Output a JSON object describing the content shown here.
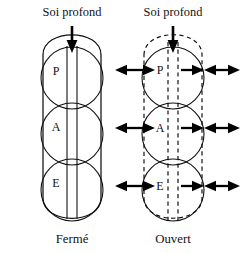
{
  "figure": {
    "background_color": "#ffffff",
    "ink_color": "#111111",
    "width": 245,
    "height": 253
  },
  "panels": [
    {
      "id": "closed",
      "top_label": "Soi profond",
      "caption": "Fermé",
      "boundary_style": "solid",
      "channel_style": "solid",
      "nodes": [
        {
          "key": "P",
          "label": "P"
        },
        {
          "key": "A",
          "label": "A"
        },
        {
          "key": "E",
          "label": "E"
        }
      ],
      "inflow_arrow": {
        "name": "down-arrow",
        "direction": "down",
        "style": "solid"
      },
      "outflow_arrows": []
    },
    {
      "id": "open",
      "top_label": "Soi profond",
      "caption": "Ouvert",
      "boundary_style": "dashed",
      "channel_style": "dashed",
      "nodes": [
        {
          "key": "P",
          "label": "P"
        },
        {
          "key": "A",
          "label": "A"
        },
        {
          "key": "E",
          "label": "E"
        }
      ],
      "inflow_arrow": {
        "name": "down-arrow",
        "direction": "down",
        "style": "solid"
      },
      "outflow_arrows": [
        {
          "row": "P",
          "side": "left",
          "direction": "bidirectional"
        },
        {
          "row": "P",
          "side": "right-inner",
          "direction": "right"
        },
        {
          "row": "P",
          "side": "right-outer",
          "direction": "bidirectional"
        },
        {
          "row": "A",
          "side": "left",
          "direction": "bidirectional"
        },
        {
          "row": "A",
          "side": "right-inner",
          "direction": "right"
        },
        {
          "row": "A",
          "side": "right-outer",
          "direction": "bidirectional"
        },
        {
          "row": "E",
          "side": "left",
          "direction": "bidirectional"
        },
        {
          "row": "E",
          "side": "right-inner",
          "direction": "right"
        },
        {
          "row": "E",
          "side": "right-outer",
          "direction": "bidirectional"
        }
      ]
    }
  ]
}
